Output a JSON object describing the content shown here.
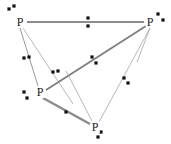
{
  "figure": {
    "type": "point-pattern-graph",
    "width": 171,
    "height": 144,
    "background_color": "#ffffff",
    "edge_color_thick": "#8c8c8c",
    "edge_color_thin": "#a6a6a6",
    "point_color": "#111111",
    "label_color": "#1a1a1a"
  },
  "nodes": [
    {
      "id": "p-top-left",
      "label": "P",
      "x": 20,
      "y": 22
    },
    {
      "id": "p-top-right",
      "label": "P",
      "x": 150,
      "y": 22
    },
    {
      "id": "p-left",
      "label": "P",
      "x": 40,
      "y": 92
    },
    {
      "id": "p-bottom",
      "label": "P",
      "x": 95,
      "y": 127
    }
  ],
  "edges": [
    {
      "id": "edge-top",
      "x1": 27,
      "y1": 22,
      "x2": 144,
      "y2": 22,
      "width": 2.2,
      "color": "#8c8c8c"
    },
    {
      "id": "edge-topleft-left",
      "x1": 20,
      "y1": 28,
      "x2": 38,
      "y2": 86,
      "width": 0.9,
      "color": "#8e8e8e"
    },
    {
      "id": "edge-topleft-cross",
      "x1": 23,
      "y1": 28,
      "x2": 73,
      "y2": 104,
      "width": 0.8,
      "color": "#a6a6a6"
    },
    {
      "id": "edge-left-topright",
      "x1": 46,
      "y1": 90,
      "x2": 146,
      "y2": 26,
      "width": 2.0,
      "color": "#7f7f7f"
    },
    {
      "id": "edge-left-bottom",
      "x1": 43,
      "y1": 98,
      "x2": 90,
      "y2": 124,
      "width": 2.4,
      "color": "#8c8c8c"
    },
    {
      "id": "edge-bottom-topright",
      "x1": 99,
      "y1": 122,
      "x2": 150,
      "y2": 28,
      "width": 0.8,
      "color": "#a6a6a6"
    },
    {
      "id": "edge-bottom-cross",
      "x1": 92,
      "y1": 121,
      "x2": 66,
      "y2": 71,
      "width": 0.8,
      "color": "#a6a6a6"
    },
    {
      "id": "edge-topright-down",
      "x1": 150,
      "y1": 28,
      "x2": 137,
      "y2": 62,
      "width": 0.8,
      "color": "#a6a6a6"
    }
  ],
  "points": [
    {
      "id": "pt-1",
      "x": 9,
      "y": 9
    },
    {
      "id": "pt-2",
      "x": 14,
      "y": 6
    },
    {
      "id": "pt-3",
      "x": 88,
      "y": 18
    },
    {
      "id": "pt-4",
      "x": 88,
      "y": 26
    },
    {
      "id": "pt-5",
      "x": 158,
      "y": 14
    },
    {
      "id": "pt-6",
      "x": 163,
      "y": 20
    },
    {
      "id": "pt-7",
      "x": 24,
      "y": 58
    },
    {
      "id": "pt-8",
      "x": 29,
      "y": 57
    },
    {
      "id": "pt-9",
      "x": 92,
      "y": 57
    },
    {
      "id": "pt-10",
      "x": 96,
      "y": 63
    },
    {
      "id": "pt-11",
      "x": 53,
      "y": 72
    },
    {
      "id": "pt-12",
      "x": 58,
      "y": 71
    },
    {
      "id": "pt-13",
      "x": 124,
      "y": 78
    },
    {
      "id": "pt-14",
      "x": 128,
      "y": 83
    },
    {
      "id": "pt-15",
      "x": 24,
      "y": 92
    },
    {
      "id": "pt-16",
      "x": 27,
      "y": 98
    },
    {
      "id": "pt-17",
      "x": 66,
      "y": 112
    },
    {
      "id": "pt-18",
      "x": 101,
      "y": 132
    },
    {
      "id": "pt-19",
      "x": 98,
      "y": 137
    }
  ]
}
